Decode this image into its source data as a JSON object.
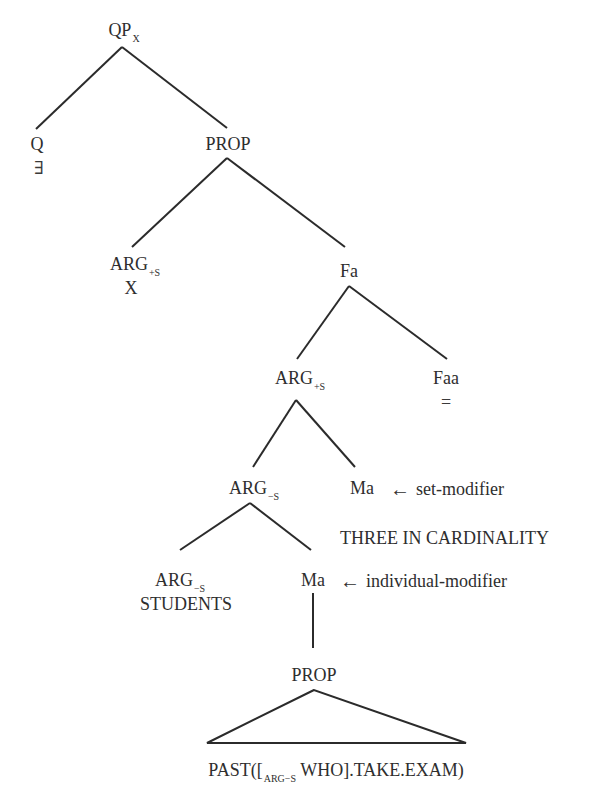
{
  "nodes": {
    "qp": {
      "label": "QP",
      "sub": "X"
    },
    "q": {
      "label": "Q",
      "value": "∃"
    },
    "prop_top": {
      "label": "PROP"
    },
    "arg_x": {
      "label": "ARG",
      "sub": "+S",
      "value": "X"
    },
    "fa": {
      "label": "Fa"
    },
    "arg_plus": {
      "label": "ARG",
      "sub": "+S"
    },
    "faa": {
      "label": "Faa",
      "value": "="
    },
    "arg_minus": {
      "label": "ARG",
      "sub": "−S"
    },
    "ma_set": {
      "label": "Ma",
      "annotation": "set-modifier",
      "value": "THREE IN CARDINALITY"
    },
    "arg_students": {
      "label": "ARG",
      "sub": "−S",
      "value": "STUDENTS"
    },
    "ma_ind": {
      "label": "Ma",
      "annotation": "individual-modifier"
    },
    "prop_bottom": {
      "label": "PROP"
    },
    "leaf": {
      "prefix": "PAST([",
      "sub": "ARG−S",
      "suffix": " WHO].TAKE.EXAM)"
    }
  },
  "icons": {
    "arrow": "←"
  },
  "colors": {
    "line": "#2b2b2b",
    "text": "#2e2e2e"
  }
}
